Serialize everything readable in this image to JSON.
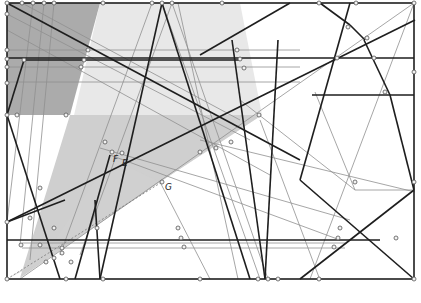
{
  "diagram": {
    "labels": {
      "F": "F",
      "E": "E",
      "G": "G"
    },
    "colors": {
      "frame": "#222222",
      "thick_line": "#1e1e1e",
      "thin_line": "#8a8a8a",
      "fill_dark": "#a8a8a8",
      "fill_mid": "#c8c8c8",
      "fill_light": "#e6e6e6",
      "vertex_fill": "#f2f2f2",
      "vertex_stroke": "#555555"
    },
    "frame": {
      "x": 7,
      "y": 3,
      "w": 407,
      "h": 276
    }
  }
}
